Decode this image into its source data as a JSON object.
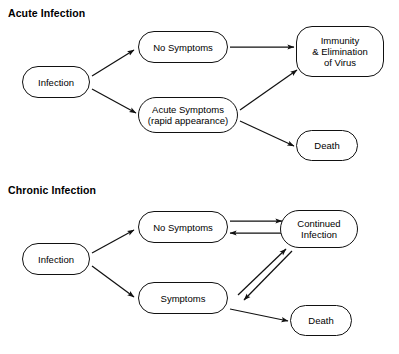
{
  "diagram": {
    "type": "flowchart",
    "background_color": "#ffffff",
    "line_color": "#111111",
    "text_color": "#000000",
    "sections": [
      {
        "id": "acute",
        "title": "Acute Infection",
        "nodes": [
          {
            "id": "acute-infection",
            "label": "Infection"
          },
          {
            "id": "acute-nosymptoms",
            "label": "No Symptoms"
          },
          {
            "id": "acute-symptoms",
            "label": "Acute Symptoms\n(rapid appearance)"
          },
          {
            "id": "acute-immunity",
            "label": "Immunity\n& Elimination\nof Virus"
          },
          {
            "id": "acute-death",
            "label": "Death"
          }
        ],
        "edges": [
          {
            "from": "acute-infection",
            "to": "acute-nosymptoms",
            "direction": "one-way"
          },
          {
            "from": "acute-infection",
            "to": "acute-symptoms",
            "direction": "one-way"
          },
          {
            "from": "acute-nosymptoms",
            "to": "acute-immunity",
            "direction": "one-way"
          },
          {
            "from": "acute-symptoms",
            "to": "acute-immunity",
            "direction": "one-way"
          },
          {
            "from": "acute-symptoms",
            "to": "acute-death",
            "direction": "one-way"
          }
        ]
      },
      {
        "id": "chronic",
        "title": "Chronic Infection",
        "nodes": [
          {
            "id": "chronic-infection",
            "label": "Infection"
          },
          {
            "id": "chronic-nosymptoms",
            "label": "No Symptoms"
          },
          {
            "id": "chronic-symptoms",
            "label": "Symptoms"
          },
          {
            "id": "chronic-continued",
            "label": "Continued\nInfection"
          },
          {
            "id": "chronic-death",
            "label": "Death"
          }
        ],
        "edges": [
          {
            "from": "chronic-infection",
            "to": "chronic-nosymptoms",
            "direction": "one-way"
          },
          {
            "from": "chronic-infection",
            "to": "chronic-symptoms",
            "direction": "one-way"
          },
          {
            "from": "chronic-nosymptoms",
            "to": "chronic-continued",
            "direction": "one-way"
          },
          {
            "from": "chronic-continued",
            "to": "chronic-nosymptoms",
            "direction": "one-way"
          },
          {
            "from": "chronic-symptoms",
            "to": "chronic-continued",
            "direction": "one-way"
          },
          {
            "from": "chronic-continued",
            "to": "chronic-symptoms",
            "direction": "one-way"
          },
          {
            "from": "chronic-symptoms",
            "to": "chronic-death",
            "direction": "one-way"
          }
        ]
      }
    ]
  },
  "caption_sliver": ""
}
